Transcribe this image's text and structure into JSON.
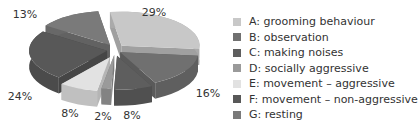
{
  "chart_data": {
    "type": "pie",
    "title": "",
    "style": "3d-exploded",
    "categories": [
      "A: grooming behaviour",
      "B: observation",
      "C: making noises",
      "D: socially aggressive",
      "E: movement – aggressive",
      "F: movement – non-aggressive",
      "G: resting"
    ],
    "values": [
      29,
      16,
      8,
      2,
      8,
      24,
      13
    ],
    "labels": [
      "29%",
      "16%",
      "8%",
      "2%",
      "8%",
      "24%",
      "13%"
    ],
    "colors": [
      "#c8c8c8",
      "#707070",
      "#5e5e5e",
      "#9a9a9a",
      "#e2e2e2",
      "#585858",
      "#7a7a7a"
    ],
    "legend_position": "right"
  }
}
